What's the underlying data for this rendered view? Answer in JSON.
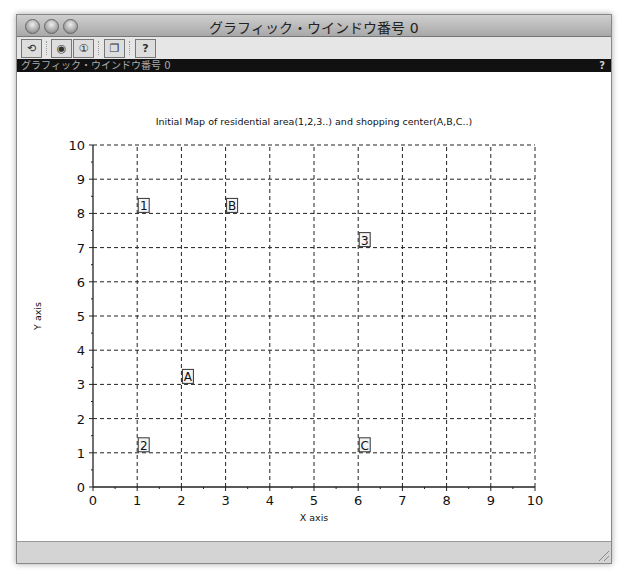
{
  "window": {
    "title": "グラフィック・ウインドウ番号 0",
    "subtitle_bar": "グラフィック・ウインドウ番号 0",
    "help_glyph": "?",
    "toolbar": [
      {
        "name": "rotate-button",
        "icon": "rotate-icon",
        "glyph": "⟲"
      },
      {
        "name": "zoom-in-button",
        "icon": "zoom-in-icon",
        "glyph": "🔍"
      },
      {
        "name": "zoom-reset-button",
        "icon": "zoom-reset-icon",
        "glyph": "①"
      },
      {
        "name": "gui-windows-button",
        "icon": "windows-icon",
        "glyph": "❐"
      },
      {
        "name": "help-button",
        "icon": "help-icon",
        "glyph": "?"
      }
    ]
  },
  "chart_data": {
    "type": "scatter",
    "title": "Initial Map of residential area(1,2,3..) and shopping center(A,B,C..)",
    "xlabel": "X axis",
    "ylabel": "Y axis",
    "xlim": [
      0,
      10
    ],
    "ylim": [
      0,
      10
    ],
    "xticks": [
      "0",
      "1",
      "2",
      "3",
      "4",
      "5",
      "6",
      "7",
      "8",
      "9",
      "10"
    ],
    "yticks": [
      "0",
      "1",
      "2",
      "3",
      "4",
      "5",
      "6",
      "7",
      "8",
      "9",
      "10"
    ],
    "grid": true,
    "points": [
      {
        "label": "1",
        "x": 1,
        "y": 8,
        "kind": "residential"
      },
      {
        "label": "2",
        "x": 1,
        "y": 1,
        "kind": "residential"
      },
      {
        "label": "3",
        "x": 6,
        "y": 7,
        "kind": "residential"
      },
      {
        "label": "A",
        "x": 2,
        "y": 3,
        "kind": "shopping"
      },
      {
        "label": "B",
        "x": 3,
        "y": 8,
        "kind": "shopping"
      },
      {
        "label": "C",
        "x": 6,
        "y": 1,
        "kind": "shopping"
      }
    ]
  }
}
